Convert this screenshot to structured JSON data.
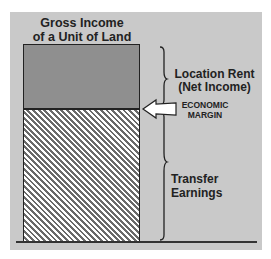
{
  "diagram": {
    "title_line1": "Gross Income",
    "title_line2": "of a Unit of Land",
    "labels": {
      "location_rent_line1": "Location Rent",
      "location_rent_line2": "(Net Income)",
      "economic_margin_line1": "ECONOMIC",
      "economic_margin_line2": "MARGIN",
      "transfer_earnings": "Transfer Earnings"
    },
    "colors": {
      "panel": "#c9c9c9",
      "location_rent_fill": "#8f8f8f",
      "hatch_dark": "#6a6a6a",
      "hatch_light": "#ffffff",
      "line": "#222222"
    }
  }
}
